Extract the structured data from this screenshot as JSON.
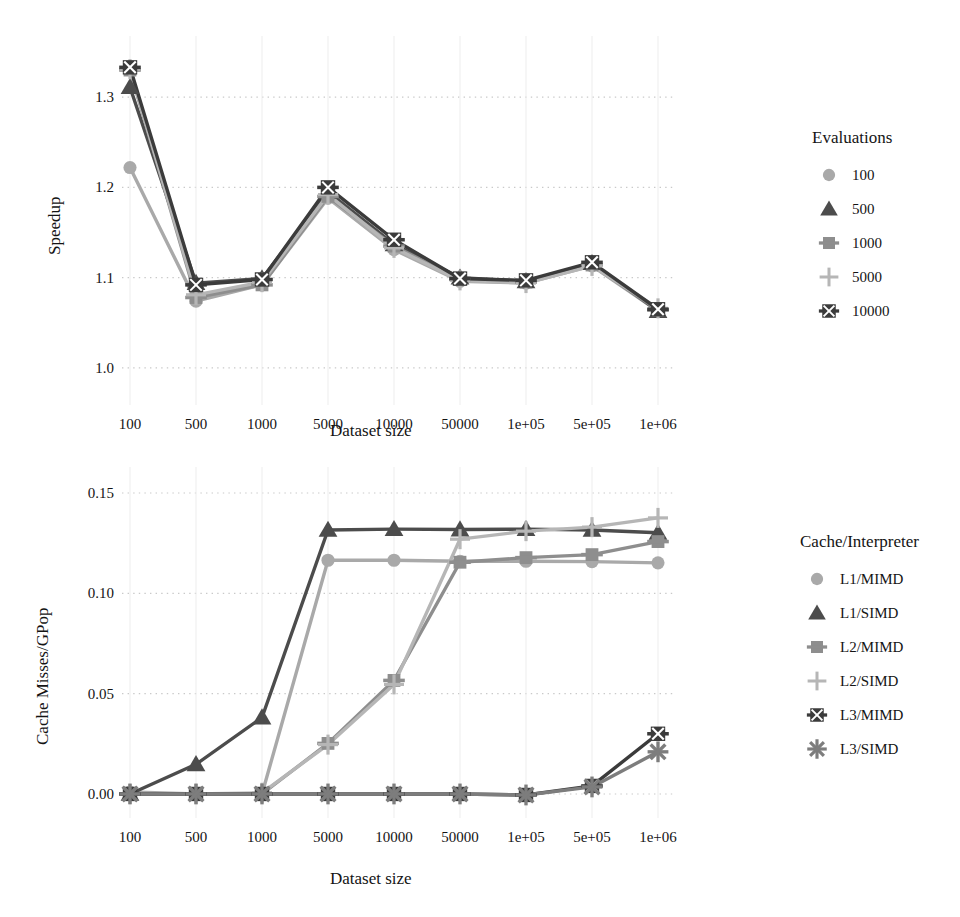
{
  "figure": {
    "background": "#ffffff",
    "grid_color": "#c9c9c9",
    "text_color": "#141414"
  },
  "panels": [
    {
      "id": "speedup-panel",
      "xlabel": "Dataset size",
      "ylabel": "Speedup",
      "legend_title": "Evaluations"
    },
    {
      "id": "cache-misses-panel",
      "xlabel": "Dataset size",
      "ylabel": "Cache Misses/GPop",
      "legend_title": "Cache/Interpreter"
    }
  ],
  "chart_data": [
    {
      "type": "line",
      "title": "",
      "xlabel": "Dataset size",
      "ylabel": "Speedup",
      "categories": [
        "100",
        "500",
        "1000",
        "5000",
        "10000",
        "50000",
        "1e+05",
        "5e+05",
        "1e+06"
      ],
      "yticks": [
        "1.0",
        "1.1",
        "1.2",
        "1.3"
      ],
      "ytickvals": [
        1.0,
        1.1,
        1.2,
        1.3
      ],
      "ylim": [
        0.97,
        1.35
      ],
      "grid": "dotted-both",
      "legend_position": "right",
      "legend_title": "Evaluations",
      "series": [
        {
          "name": "100",
          "marker": "circle",
          "color": "#a9a9a9",
          "values": [
            1.222,
            1.074,
            1.092,
            1.188,
            1.131,
            1.096,
            1.094,
            1.113,
            1.063
          ]
        },
        {
          "name": "500",
          "marker": "triangle",
          "color": "#4c4c4c",
          "values": [
            1.311,
            1.094,
            1.099,
            1.195,
            1.137,
            1.1,
            1.096,
            1.116,
            1.063
          ]
        },
        {
          "name": "1000",
          "marker": "square",
          "color": "#8e8e8e",
          "values": [
            1.33,
            1.078,
            1.092,
            1.19,
            1.135,
            1.098,
            1.095,
            1.114,
            1.064
          ]
        },
        {
          "name": "5000",
          "marker": "plus",
          "color": "#b6b6b6",
          "values": [
            1.331,
            1.081,
            1.095,
            1.192,
            1.133,
            1.097,
            1.094,
            1.113,
            1.066
          ]
        },
        {
          "name": "10000",
          "marker": "square-x",
          "color": "#3b3b3b",
          "values": [
            1.333,
            1.092,
            1.098,
            1.2,
            1.142,
            1.099,
            1.097,
            1.117,
            1.065
          ]
        }
      ]
    },
    {
      "type": "line",
      "title": "",
      "xlabel": "Dataset size",
      "ylabel": "Cache Misses/GPop",
      "categories": [
        "100",
        "500",
        "1000",
        "5000",
        "10000",
        "50000",
        "1e+05",
        "5e+05",
        "1e+06"
      ],
      "yticks": [
        "0.00",
        "0.05",
        "0.10",
        "0.15"
      ],
      "ytickvals": [
        0.0,
        0.05,
        0.1,
        0.15
      ],
      "ylim": [
        -0.007,
        0.155
      ],
      "grid": "dotted-both",
      "legend_position": "right",
      "legend_title": "Cache/Interpreter",
      "series": [
        {
          "name": "L1/MIMD",
          "marker": "circle",
          "color": "#a9a9a9",
          "values": [
            0.001,
            0.0,
            0.0,
            0.1165,
            0.1165,
            0.116,
            0.116,
            0.1158,
            0.1152
          ]
        },
        {
          "name": "L1/SIMD",
          "marker": "triangle",
          "color": "#4c4c4c",
          "values": [
            0.0,
            0.0148,
            0.0381,
            0.1316,
            0.132,
            0.1318,
            0.132,
            0.1316,
            0.1302
          ]
        },
        {
          "name": "L2/MIMD",
          "marker": "square",
          "color": "#8e8e8e",
          "values": [
            0.0,
            0.0,
            0.0,
            0.0252,
            0.0566,
            0.1155,
            0.1178,
            0.1193,
            0.1258
          ]
        },
        {
          "name": "L2/SIMD",
          "marker": "plus",
          "color": "#b6b6b6",
          "values": [
            0.0,
            0.0,
            0.0006,
            0.0246,
            0.0546,
            0.127,
            0.131,
            0.133,
            0.1376
          ]
        },
        {
          "name": "L3/MIMD",
          "marker": "square-x",
          "color": "#3b3b3b",
          "values": [
            0.0,
            0.0,
            0.0,
            0.0,
            0.0,
            0.0,
            -0.0005,
            0.004,
            0.03
          ]
        },
        {
          "name": "L3/SIMD",
          "marker": "star",
          "color": "#7d7d7d",
          "values": [
            0.0,
            0.0,
            0.0,
            0.0,
            0.0,
            0.0,
            -0.0005,
            0.0035,
            0.021
          ]
        }
      ]
    }
  ]
}
